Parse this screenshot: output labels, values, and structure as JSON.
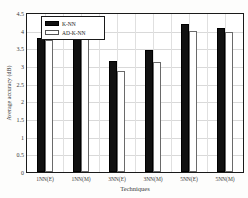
{
  "chart_data": {
    "type": "bar",
    "title": "",
    "xlabel": "Techniques",
    "ylabel": "Average accuracy (dB)",
    "ylim": [
      0,
      4.5
    ],
    "ytick_step": 0.5,
    "ytick_labels": [
      "0",
      "0.5",
      "1",
      "1.5",
      "2",
      "2.5",
      "3",
      "3.5",
      "4",
      "4.5"
    ],
    "grid": true,
    "legend_position": "top-left",
    "categories": [
      "1NN(E)",
      "1NN(M)",
      "3NN(E)",
      "3NN(M)",
      "5NN(E)",
      "5NN(M)"
    ],
    "series": [
      {
        "name": "K-NN",
        "color": "#111111",
        "values": [
          3.78,
          3.82,
          3.15,
          3.45,
          4.18,
          4.08
        ]
      },
      {
        "name": "AD-K-NN",
        "color": "#ffffff",
        "values": [
          3.75,
          3.77,
          2.85,
          3.1,
          3.98,
          3.95
        ]
      }
    ]
  }
}
